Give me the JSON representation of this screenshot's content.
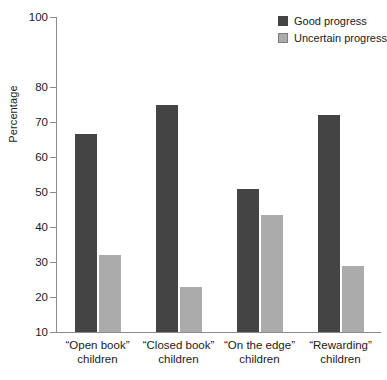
{
  "chart_data": {
    "type": "bar",
    "title": "",
    "xlabel": "",
    "ylabel": "Percentage",
    "ylim": [
      10,
      100
    ],
    "grid": false,
    "legend_position": "top-right",
    "categories": [
      "“Open book” children",
      "“Closed book” children",
      "“On the edge” children",
      "“Rewarding” children"
    ],
    "category_lines": [
      {
        "line1": "“Open book”",
        "line2": "children"
      },
      {
        "line1": "“Closed book”",
        "line2": "children"
      },
      {
        "line1": "“On the edge”",
        "line2": "children"
      },
      {
        "line1": "“Rewarding”",
        "line2": "children"
      }
    ],
    "series": [
      {
        "name": "Good progress",
        "color": "#444444",
        "values": [
          66.5,
          75.0,
          51.0,
          72.0
        ]
      },
      {
        "name": "Uncertain progress",
        "color": "#ababab",
        "values": [
          32.0,
          23.0,
          43.5,
          29.0
        ]
      }
    ],
    "yticks": [
      10,
      20,
      30,
      40,
      50,
      60,
      70,
      80,
      100
    ],
    "ytick_labels": [
      "10",
      "20",
      "30",
      "40",
      "50",
      "60",
      "70",
      "80",
      "100"
    ]
  },
  "legend": {
    "items": [
      {
        "label": "Good progress"
      },
      {
        "label": "Uncertain progress"
      }
    ]
  },
  "colors": {
    "good_progress": "#444444",
    "uncertain_progress": "#ababab",
    "axis": "#8b8b8b",
    "text": "#1a1a1a",
    "background": "#ffffff"
  }
}
